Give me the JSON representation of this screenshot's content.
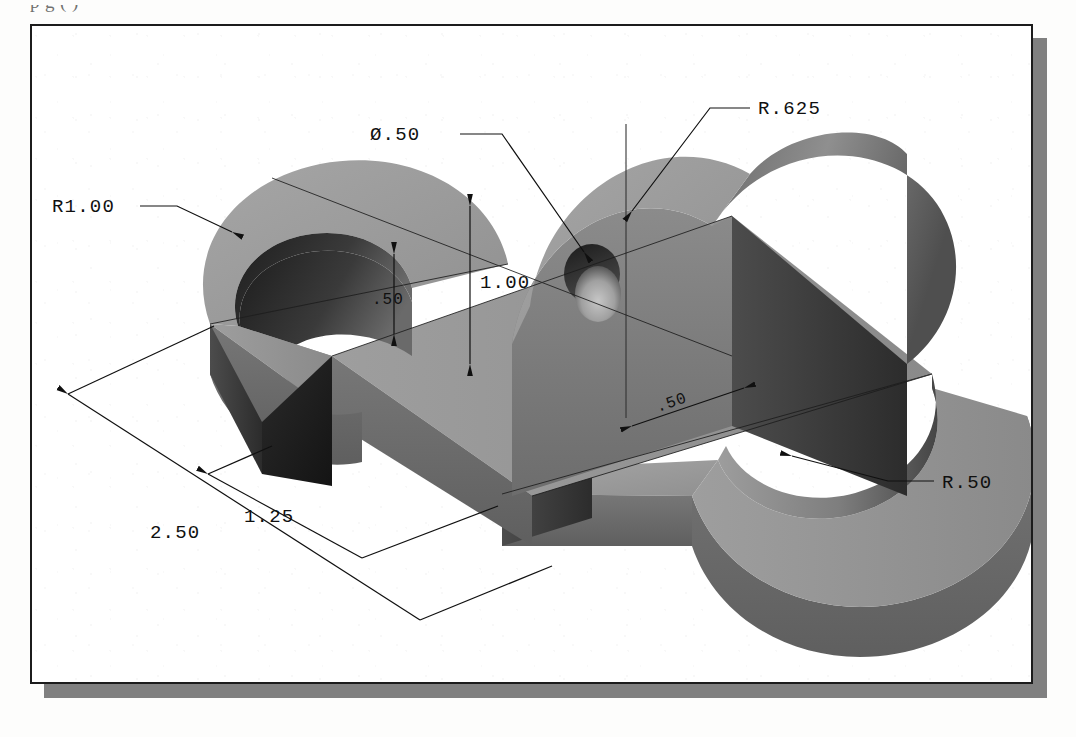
{
  "page": {
    "clipped_heading_text": "p  g      (                           )",
    "background_color": "#fdfdfc",
    "frame_border_color": "#1c1c1c",
    "frame_shadow_color": "#808080",
    "paper_color": "#ffffff"
  },
  "drawing": {
    "title": "Isometric pictorial of S-shaped plate with upright boss",
    "projection": "isometric",
    "units": "inches",
    "line_color": "#101010",
    "shading": {
      "top_face": "#9a9a9a",
      "top_face_light": "#a8a8a8",
      "front_face": "#6e6e6e",
      "right_face": "#555555",
      "end_cap_dark": "#1f1f1f",
      "inner_arc_dark": "#2b2b2b",
      "boss_face": "#7a7a7a",
      "boss_top": "#8c8c8c",
      "hole_rim": "#262626",
      "hole_bore": "#b5b5b5"
    }
  },
  "dimensions": [
    {
      "id": "r1-00",
      "label": "R1.00",
      "type": "radius",
      "value": 1.0,
      "kind": "leader"
    },
    {
      "id": "dia-50",
      "label": "Ø.50",
      "type": "diameter",
      "value": 0.5,
      "kind": "leader"
    },
    {
      "id": "r-625",
      "label": "R.625",
      "type": "radius",
      "value": 0.625,
      "kind": "leader"
    },
    {
      "id": "r-50",
      "label": "R.50",
      "type": "radius",
      "value": 0.5,
      "kind": "leader"
    },
    {
      "id": "h-1-00",
      "label": "1.00",
      "type": "linear",
      "value": 1.0,
      "kind": "vertical"
    },
    {
      "id": "h-50",
      "label": ".50",
      "type": "linear",
      "value": 0.5,
      "kind": "vertical"
    },
    {
      "id": "w-50",
      "label": ".50",
      "type": "linear",
      "value": 0.5,
      "kind": "inclined"
    },
    {
      "id": "len-2-50",
      "label": "2.50",
      "type": "linear",
      "value": 2.5,
      "kind": "inclined"
    },
    {
      "id": "len-1-25",
      "label": "1.25",
      "type": "linear",
      "value": 1.25,
      "kind": "inclined"
    }
  ]
}
